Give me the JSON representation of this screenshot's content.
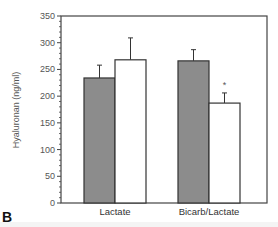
{
  "chart_data": {
    "type": "bar",
    "title": "",
    "panel_label": "B",
    "xlabel": "",
    "ylabel": "Hyaluronan (ng/ml)",
    "ylim": [
      0,
      350
    ],
    "yticks": [
      0,
      50,
      100,
      150,
      200,
      250,
      300,
      350
    ],
    "grid": false,
    "legend": null,
    "categories": [
      "Lactate",
      "Bicarb/Lactate"
    ],
    "series": [
      {
        "name": "shaded",
        "color": "#8c8c8c",
        "values": [
          234,
          266
        ],
        "errors": [
          24,
          21
        ]
      },
      {
        "name": "open",
        "color": "#ffffff",
        "values": [
          268,
          187
        ],
        "errors": [
          41,
          19
        ]
      }
    ],
    "annotations": [
      {
        "text": "*",
        "category": "Bicarb/Lactate",
        "series": "open"
      }
    ]
  },
  "labels": {
    "panel": "B",
    "ylabel": "Hyaluronan (ng/ml)",
    "significance": "*"
  },
  "colors": {
    "axis": "#444444",
    "shaded_bar": "#8c8c8c",
    "open_bar": "#ffffff"
  }
}
